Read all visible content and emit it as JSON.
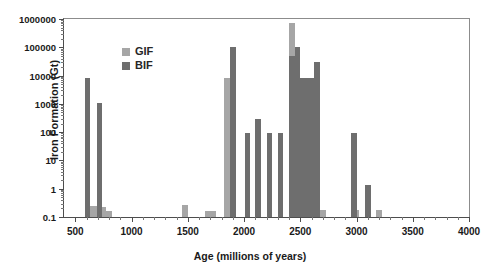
{
  "chart_data": {
    "type": "bar",
    "title": "",
    "xlabel": "Age (millions of years)",
    "ylabel": "Iron Formation (Gt)",
    "xlim": [
      400,
      4000
    ],
    "ylim": [
      0.1,
      1000000
    ],
    "yscale": "log",
    "grid": false,
    "legend_position": "upper-left-inside",
    "xticks": [
      500,
      1000,
      1500,
      2000,
      2500,
      3000,
      3500,
      4000
    ],
    "xticklabels": [
      "500",
      "1000",
      "1500",
      "2000",
      "2500",
      "3000",
      "3500",
      "4000"
    ],
    "xminorticks": [
      600,
      700,
      800,
      900,
      1100,
      1200,
      1300,
      1400,
      1600,
      1700,
      1800,
      1900,
      2100,
      2200,
      2300,
      2400,
      2600,
      2700,
      2800,
      2900,
      3100,
      3200,
      3300,
      3400,
      3600,
      3700,
      3800,
      3900
    ],
    "yticks": [
      0.1,
      1,
      10,
      100,
      1000,
      10000,
      100000,
      1000000
    ],
    "yticklabels": [
      "0.1",
      "1",
      "10",
      "100",
      "1000",
      "10000",
      "100000",
      "1000000"
    ],
    "bar_width_myr": 50,
    "series": [
      {
        "name": "GIF",
        "color": "#a6a6a6",
        "points": [
          {
            "x": 650,
            "y": 0.25
          },
          {
            "x": 700,
            "y": 0.25
          },
          {
            "x": 750,
            "y": 0.22
          },
          {
            "x": 800,
            "y": 0.16
          },
          {
            "x": 1475,
            "y": 0.26
          },
          {
            "x": 1675,
            "y": 0.16
          },
          {
            "x": 1725,
            "y": 0.16
          },
          {
            "x": 1850,
            "y": 8000
          },
          {
            "x": 2425,
            "y": 700000
          },
          {
            "x": 2700,
            "y": 0.17
          },
          {
            "x": 3000,
            "y": 0.18
          },
          {
            "x": 3200,
            "y": 0.17
          }
        ]
      },
      {
        "name": "BIF",
        "color": "#6e6e6e",
        "points": [
          {
            "x": 610,
            "y": 8000
          },
          {
            "x": 715,
            "y": 1100
          },
          {
            "x": 1900,
            "y": 100000
          },
          {
            "x": 2030,
            "y": 95
          },
          {
            "x": 2125,
            "y": 300
          },
          {
            "x": 2225,
            "y": 95
          },
          {
            "x": 2325,
            "y": 95
          },
          {
            "x": 2425,
            "y": 48000
          },
          {
            "x": 2475,
            "y": 100000
          },
          {
            "x": 2525,
            "y": 8000
          },
          {
            "x": 2575,
            "y": 8000
          },
          {
            "x": 2625,
            "y": 8000
          },
          {
            "x": 2650,
            "y": 30000
          },
          {
            "x": 2975,
            "y": 95
          },
          {
            "x": 3100,
            "y": 1.4
          }
        ]
      }
    ]
  },
  "legend": {
    "items": [
      {
        "label": "GIF",
        "color": "#a6a6a6"
      },
      {
        "label": "BIF",
        "color": "#6e6e6e"
      }
    ]
  }
}
